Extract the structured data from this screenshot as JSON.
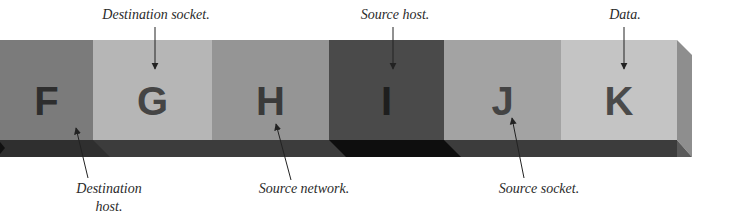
{
  "diagram": {
    "type": "field-bar",
    "segments": [
      {
        "letter": "F",
        "fill": "#7b7b7b",
        "text": "#2e2e2e",
        "x": 0,
        "w": 93
      },
      {
        "letter": "G",
        "fill": "#b6b6b6",
        "text": "#454545",
        "x": 93,
        "w": 119
      },
      {
        "letter": "H",
        "fill": "#959595",
        "text": "#3a3a3a",
        "x": 212,
        "w": 117
      },
      {
        "letter": "I",
        "fill": "#4a4a4a",
        "text": "#1e1e1e",
        "x": 329,
        "w": 115
      },
      {
        "letter": "J",
        "fill": "#a3a3a3",
        "text": "#444444",
        "x": 444,
        "w": 117
      },
      {
        "letter": "K",
        "fill": "#c4c4c4",
        "text": "#4a4a4a",
        "x": 561,
        "w": 116
      }
    ],
    "labels_top": [
      {
        "text": "Destination socket.",
        "points_to": "G"
      },
      {
        "text": "Source host.",
        "points_to": "I"
      },
      {
        "text": "Data.",
        "points_to": "K"
      }
    ],
    "labels_bottom": [
      {
        "text": "Destination",
        "text2": "host.",
        "points_to": "F"
      },
      {
        "text": "Source network.",
        "points_to": "H"
      },
      {
        "text": "Source socket.",
        "points_to": "J"
      }
    ],
    "colors": {
      "shadow": "#3c3c3c",
      "shadow_dark": "#0e0e0e",
      "end_face": "#8e8e8e",
      "arrow": "#222222",
      "background": "#ffffff"
    }
  }
}
